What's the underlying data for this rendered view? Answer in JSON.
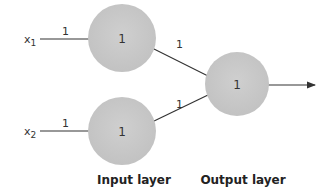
{
  "diagram": {
    "type": "perceptron-network",
    "colors": {
      "node_fill": "#c8c8c8",
      "edge": "#333333",
      "text": "#333333"
    },
    "inputs": [
      {
        "id": "x1",
        "label": "x",
        "subscript": "1",
        "weight": "1"
      },
      {
        "id": "x2",
        "label": "x",
        "subscript": "2",
        "weight": "1"
      }
    ],
    "input_nodes": [
      {
        "id": "in1",
        "value": "1"
      },
      {
        "id": "in2",
        "value": "1"
      }
    ],
    "output_node": {
      "id": "out",
      "value": "1"
    },
    "hidden_weights": [
      {
        "from": "in1",
        "to": "out",
        "weight": "1"
      },
      {
        "from": "in2",
        "to": "out",
        "weight": "1"
      }
    ],
    "layer_labels": {
      "input": "Input layer",
      "output": "Output layer"
    }
  }
}
